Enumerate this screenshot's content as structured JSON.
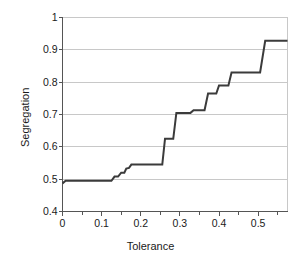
{
  "chart_data": {
    "type": "line",
    "title": "",
    "xlabel": "Tolerance",
    "ylabel": "Segregation",
    "xlim": [
      0,
      0.575
    ],
    "ylim": [
      0.4,
      1.0
    ],
    "xticks": [
      0,
      0.1,
      0.2,
      0.3,
      0.4,
      0.5
    ],
    "xtick_labels": [
      "0",
      "0.1",
      "0.2",
      "0.3",
      "0.4",
      "0.5"
    ],
    "yticks": [
      0.4,
      0.5,
      0.6,
      0.7,
      0.8,
      0.9,
      1.0
    ],
    "ytick_labels": [
      "0.4",
      "0.5",
      "0.6",
      "0.7",
      "0.8",
      "0.9",
      "1"
    ],
    "xtick_minor_step": 0.05,
    "grid": "horizontal",
    "legend": "none",
    "line_color": "#3b3b3b",
    "line_width": 2,
    "series": [
      {
        "name": "Segregation vs Tolerance",
        "step": "post",
        "points": [
          [
            0.0,
            0.487
          ],
          [
            0.008,
            0.495
          ],
          [
            0.125,
            0.495
          ],
          [
            0.133,
            0.508
          ],
          [
            0.142,
            0.508
          ],
          [
            0.15,
            0.52
          ],
          [
            0.158,
            0.52
          ],
          [
            0.163,
            0.533
          ],
          [
            0.17,
            0.535
          ],
          [
            0.176,
            0.545
          ],
          [
            0.255,
            0.545
          ],
          [
            0.262,
            0.625
          ],
          [
            0.283,
            0.625
          ],
          [
            0.291,
            0.705
          ],
          [
            0.327,
            0.705
          ],
          [
            0.335,
            0.713
          ],
          [
            0.363,
            0.713
          ],
          [
            0.372,
            0.765
          ],
          [
            0.393,
            0.765
          ],
          [
            0.4,
            0.79
          ],
          [
            0.424,
            0.79
          ],
          [
            0.432,
            0.83
          ],
          [
            0.505,
            0.83
          ],
          [
            0.518,
            0.928
          ],
          [
            0.575,
            0.928
          ]
        ]
      }
    ]
  },
  "axes": {
    "frame_color": "#b8b8b8",
    "grid_color": "#c8c8c8",
    "axis_line_color": "#555555"
  }
}
